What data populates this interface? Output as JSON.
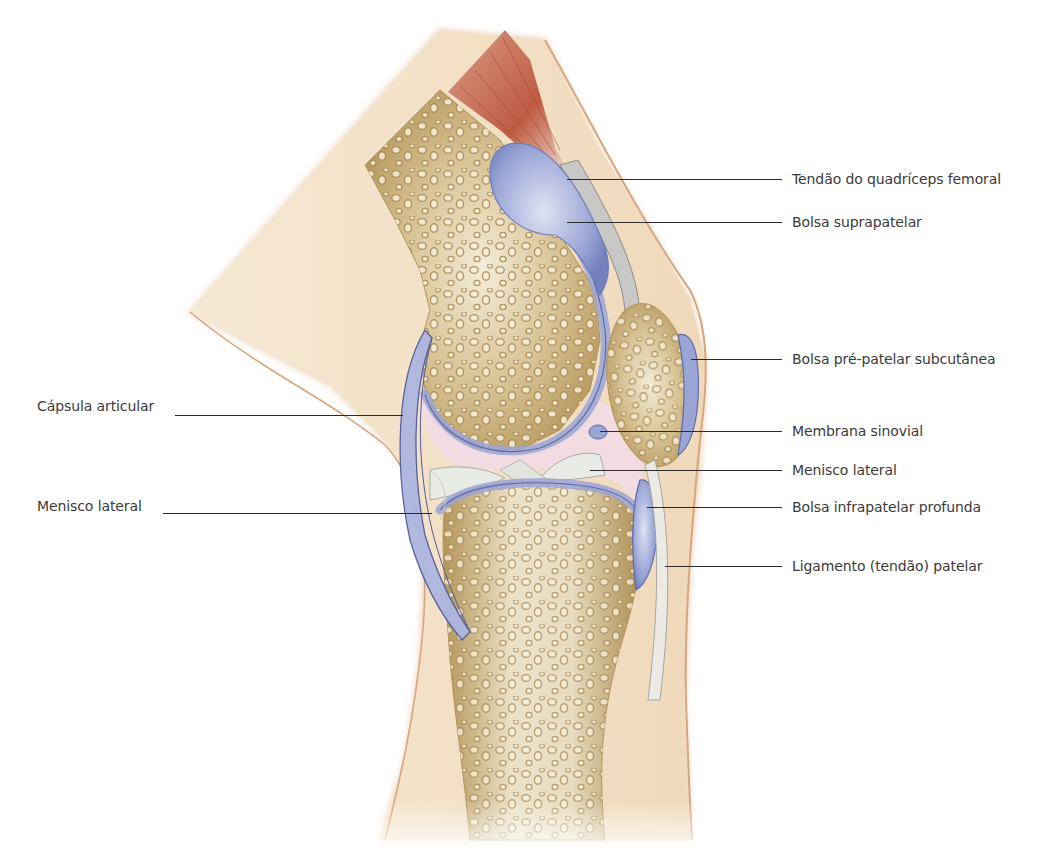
{
  "figure": {
    "colors": {
      "skin": "#f3dfc3",
      "skin_outline": "#d9a57c",
      "bone": "#c9ae78",
      "bone_dark": "#a98a52",
      "bone_light": "#efe6cf",
      "bursa": "#9aa5d6",
      "bursa_dark": "#5e6aa8",
      "synovial_pink": "#f2dbe6",
      "meniscus": "#e9ebe6",
      "tendon": "#c8c8c6",
      "muscle": "#c2664e",
      "leader": "#2b2b2b",
      "label_text": "#3a3a3a"
    }
  },
  "labels": {
    "right": [
      {
        "id": "quadriceps-tendon",
        "text": "Tendão do quadríceps femoral",
        "y": 179,
        "line_from": 567
      },
      {
        "id": "suprapatellar-bursa",
        "text": "Bolsa suprapatelar",
        "y": 222,
        "line_from": 567
      },
      {
        "id": "prepatellar-bursa",
        "text": "Bolsa pré-patelar subcutânea",
        "y": 359,
        "line_from": 691
      },
      {
        "id": "synovial-membrane",
        "text": "Membrana sinovial",
        "y": 431,
        "line_from": 600
      },
      {
        "id": "lateral-meniscus-right",
        "text": "Menisco lateral",
        "y": 470,
        "line_from": 590
      },
      {
        "id": "deep-infrapatellar-bursa",
        "text": "Bolsa infrapatelar profunda",
        "y": 507,
        "line_from": 647
      },
      {
        "id": "patellar-ligament",
        "text": "Ligamento (tendão) patelar",
        "y": 566,
        "line_from": 665
      }
    ],
    "left": [
      {
        "id": "joint-capsule",
        "text": "Cápsula articular",
        "y": 415,
        "line_from": 175,
        "line_to": 403
      },
      {
        "id": "lateral-meniscus-left",
        "text": "Menisco lateral",
        "y": 513,
        "line_from": 163,
        "line_to": 432
      }
    ]
  }
}
